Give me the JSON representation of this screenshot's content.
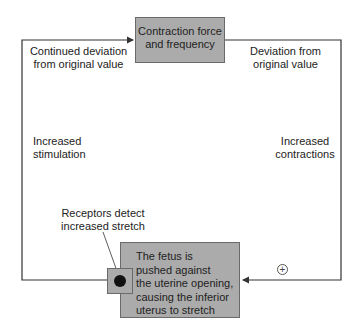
{
  "diagram": {
    "type": "positive feedback loop",
    "top_box": {
      "lines": [
        "Contraction force",
        "and frequency"
      ]
    },
    "bottom_box": {
      "lines": [
        "The fetus is",
        "pushed against",
        "the uterine opening,",
        "causing the inferior",
        "uterus to stretch"
      ]
    },
    "labels": {
      "top_left": [
        "Continued deviation",
        "from original value"
      ],
      "top_right": [
        "Deviation from",
        "original value"
      ],
      "mid_left": [
        "Increased",
        "stimulation"
      ],
      "mid_right": [
        "Increased",
        "contractions"
      ],
      "receptors": [
        "Receptors detect",
        "increased stretch"
      ]
    },
    "sign": "+",
    "colors": {
      "box_fill": "#ababab",
      "box_border": "#6a6a6a",
      "line": "#333333",
      "dot": "#111111"
    }
  }
}
